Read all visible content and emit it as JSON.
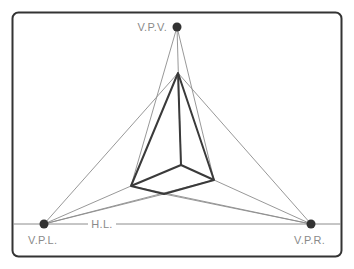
{
  "diagram": {
    "labels": {
      "vpv": "V.P.V.",
      "vpl": "V.P.L.",
      "vpr": "V.P.R.",
      "hl": "H.L."
    },
    "colors": {
      "frame": "#333333",
      "guide": "#8c8c8c",
      "box": "#3a3a3a",
      "point": "#333333",
      "label": "#8a8a8a"
    },
    "points": {
      "vpv": [
        177,
        27
      ],
      "vpl": [
        44,
        224
      ],
      "vpr": [
        311,
        224
      ]
    },
    "box_vertices": {
      "top": [
        178,
        73
      ],
      "left": [
        131,
        186
      ],
      "bottom": [
        164,
        194
      ],
      "right": [
        214,
        180
      ],
      "inner": [
        181,
        165
      ]
    }
  }
}
